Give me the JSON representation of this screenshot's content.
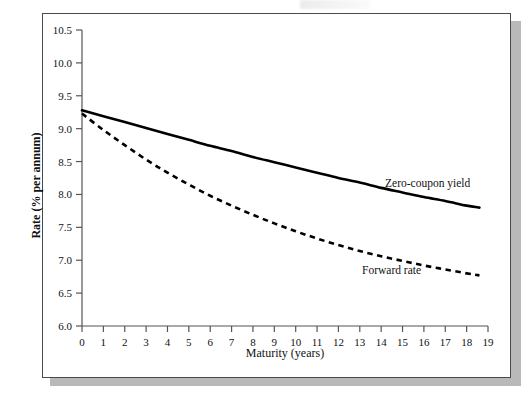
{
  "figure": {
    "background_color": "#ffffff",
    "frame_color": "#4a4a4a",
    "shadow_color": "#b9b9b9"
  },
  "chart_data": {
    "type": "line",
    "title": "",
    "subtitle": "",
    "xlabel": "Maturity (years)",
    "ylabel": "Rate (% per annum)",
    "xlim": [
      0,
      19
    ],
    "ylim": [
      6.0,
      10.5
    ],
    "grid": false,
    "legend_position": "inline-annotation",
    "xticks": [
      0,
      1,
      2,
      3,
      4,
      5,
      6,
      7,
      8,
      9,
      10,
      11,
      12,
      13,
      14,
      15,
      16,
      17,
      18,
      19
    ],
    "xtick_labels": [
      "0",
      "1",
      "2",
      "3",
      "4",
      "5",
      "6",
      "7",
      "8",
      "9",
      "10",
      "11",
      "12",
      "13",
      "14",
      "15",
      "16",
      "17",
      "18",
      "19"
    ],
    "yticks": [
      6.0,
      6.5,
      7.0,
      7.5,
      8.0,
      8.5,
      9.0,
      9.5,
      10.0,
      10.5
    ],
    "ytick_labels": [
      "6.0",
      "6.5",
      "7.0",
      "7.5",
      "8.0",
      "8.5",
      "9.0",
      "9.5",
      "10.0",
      "10.5"
    ],
    "x": [
      0,
      1,
      2,
      3,
      4,
      5,
      6,
      7,
      8,
      9,
      10,
      11,
      12,
      13,
      14,
      15,
      16,
      17,
      18,
      18.6
    ],
    "series": [
      {
        "name": "Zero-coupon yield",
        "style": "solid",
        "color": "#000000",
        "line_width": 2.6,
        "annotation": "Zero-coupon yield",
        "values": [
          9.28,
          9.19,
          9.1,
          9.01,
          8.92,
          8.83,
          8.74,
          8.66,
          8.57,
          8.49,
          8.41,
          8.33,
          8.25,
          8.18,
          8.1,
          8.03,
          7.96,
          7.9,
          7.83,
          7.8
        ]
      },
      {
        "name": "Forward rate",
        "style": "dashed",
        "color": "#000000",
        "line_width": 2.6,
        "annotation": "Forward rate",
        "values": [
          9.23,
          8.98,
          8.75,
          8.53,
          8.33,
          8.15,
          7.98,
          7.83,
          7.69,
          7.56,
          7.44,
          7.33,
          7.23,
          7.14,
          7.06,
          6.99,
          6.92,
          6.86,
          6.8,
          6.77
        ]
      }
    ]
  }
}
